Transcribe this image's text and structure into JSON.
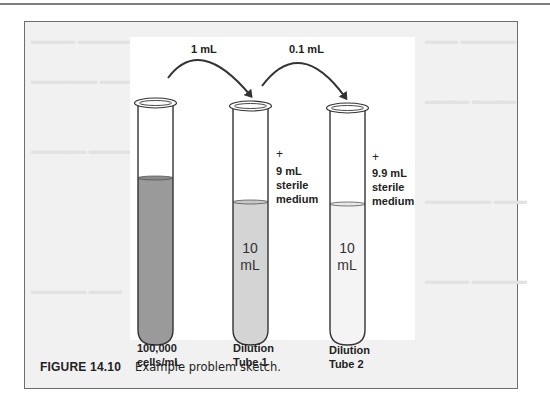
{
  "figure": {
    "number": "FIGURE 14.10",
    "caption": "Example problem sketch.",
    "colors": {
      "frame_border": "#6e6e6e",
      "frame_background": "#f1f1f1",
      "stock_liquid": "#9a9a9a",
      "tube1_liquid": "#d4d4d4",
      "tube2_liquid": "#f4f4f4",
      "outline": "#333333"
    }
  },
  "transfers": [
    {
      "label": "1 mL",
      "from": "stock",
      "to": "dilution-tube-1"
    },
    {
      "label": "0.1 mL",
      "from": "dilution-tube-1",
      "to": "dilution-tube-2"
    }
  ],
  "tubes": [
    {
      "id": "stock",
      "label_line1": "100,000",
      "label_line2": "cells/mL",
      "volume_line1": "",
      "volume_line2": "",
      "added_plus": "",
      "added_line1": "",
      "added_line2": "",
      "added_line3": ""
    },
    {
      "id": "dilution-tube-1",
      "label_line1": "Dilution",
      "label_line2": "Tube 1",
      "volume_line1": "10",
      "volume_line2": "mL",
      "added_plus": "+",
      "added_line1": "9 mL",
      "added_line2": "sterile",
      "added_line3": "medium"
    },
    {
      "id": "dilution-tube-2",
      "label_line1": "Dilution",
      "label_line2": "Tube 2",
      "volume_line1": "10",
      "volume_line2": "mL",
      "added_plus": "+",
      "added_line1": "9.9 mL",
      "added_line2": "sterile",
      "added_line3": "medium"
    }
  ]
}
